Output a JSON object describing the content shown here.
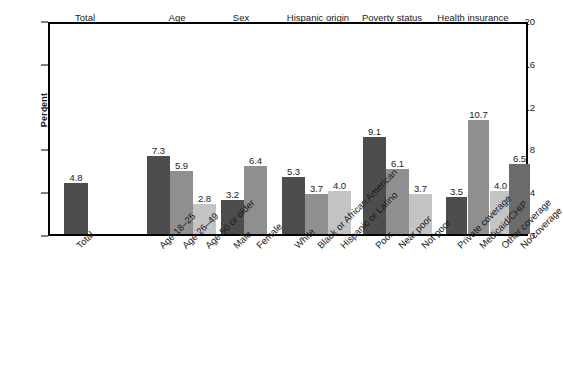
{
  "chart_data": {
    "type": "bar",
    "title": "",
    "xlabel": "",
    "ylabel": "Percent",
    "ylim": [
      0,
      20
    ],
    "yticks": [
      0,
      4,
      8,
      12,
      16,
      20
    ],
    "grid": false,
    "legend": "none",
    "orientation": "vertical",
    "value_labels": true,
    "groups": [
      {
        "header": "Total",
        "categories": [
          "Total"
        ],
        "values": [
          4.8
        ],
        "shades": [
          0
        ]
      },
      {
        "header": "Age",
        "categories": [
          "Age 18–25",
          "Age 26–49",
          "Age 50 or older"
        ],
        "values": [
          7.3,
          5.9,
          2.8
        ],
        "shades": [
          0,
          1,
          2
        ]
      },
      {
        "header": "Sex",
        "categories": [
          "Male",
          "Female"
        ],
        "values": [
          3.2,
          6.4
        ],
        "shades": [
          0,
          1
        ]
      },
      {
        "header": "Hispanic origin and race",
        "header_lines": [
          "Hispanic origin",
          "and race"
        ],
        "categories": [
          "White",
          "Black or African American",
          "Hispanic or Latino"
        ],
        "values": [
          5.3,
          3.7,
          4.0
        ],
        "shades": [
          0,
          1,
          2
        ]
      },
      {
        "header": "Poverty status",
        "header_lines": [
          "Poverty status"
        ],
        "categories": [
          "Poor",
          "Near poor",
          "Not poor"
        ],
        "values": [
          9.1,
          6.1,
          3.7
        ],
        "shades": [
          0,
          1,
          2
        ]
      },
      {
        "header": "Health insurance status",
        "header_lines": [
          "Health insurance",
          "status"
        ],
        "categories": [
          "Private coverage",
          "Medicaid/CHIP",
          "Other coverage",
          "No coverage"
        ],
        "values": [
          3.5,
          10.7,
          4.0,
          6.5
        ],
        "shades": [
          0,
          1,
          2,
          3
        ]
      }
    ]
  },
  "colors": {
    "shade_dark": "#4d4d4d",
    "shade_medium": "#8f8f8f",
    "shade_light": "#c4c4c4",
    "shade_mid_dark": "#6b6b6b",
    "axis": "#000000"
  },
  "footnote": ""
}
